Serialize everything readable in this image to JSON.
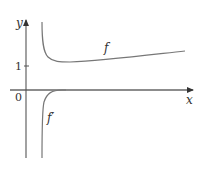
{
  "figure": {
    "axes": {
      "x_label": "x",
      "y_label": "y",
      "origin_label": "0",
      "y_tick_label": "1"
    },
    "curves": [
      {
        "name": "f",
        "label": "f",
        "description": "decreasing steeply from near x=0+, minimum slightly above y=1, then slowly increasing"
      },
      {
        "name": "f_prime",
        "label": "f′",
        "description": "large negative near x=0+, rising to approach 0 from below"
      }
    ],
    "colors": {
      "axis": "#555555",
      "curve": "#777777",
      "text": "#333333",
      "background": "#ffffff"
    }
  }
}
